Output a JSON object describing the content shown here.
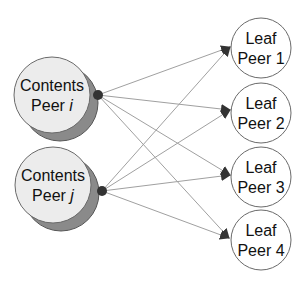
{
  "diagram": {
    "colors": {
      "background": "#ffffff",
      "content_fill": "#ececec",
      "content_shadow": "#8a8a8a",
      "leaf_fill": "#ffffff",
      "outline": "#6a6a6a",
      "edge": "#a0a0a0",
      "arrowhead": "#333333",
      "source_dot": "#333333"
    },
    "content_peers": [
      {
        "id": "i",
        "line1": "Contents",
        "line2_prefix": "Peer ",
        "line2_var": "i"
      },
      {
        "id": "j",
        "line1": "Contents",
        "line2_prefix": "Peer ",
        "line2_var": "j"
      }
    ],
    "leaf_peers": [
      {
        "id": "1",
        "line1": "Leaf",
        "line2": "Peer 1"
      },
      {
        "id": "2",
        "line1": "Leaf",
        "line2": "Peer 2"
      },
      {
        "id": "3",
        "line1": "Leaf",
        "line2": "Peer 3"
      },
      {
        "id": "4",
        "line1": "Leaf",
        "line2": "Peer 4"
      }
    ],
    "edges": [
      {
        "from": "i",
        "to": "1"
      },
      {
        "from": "i",
        "to": "2"
      },
      {
        "from": "i",
        "to": "3"
      },
      {
        "from": "i",
        "to": "4"
      },
      {
        "from": "j",
        "to": "1"
      },
      {
        "from": "j",
        "to": "2"
      },
      {
        "from": "j",
        "to": "3"
      },
      {
        "from": "j",
        "to": "4"
      }
    ]
  }
}
